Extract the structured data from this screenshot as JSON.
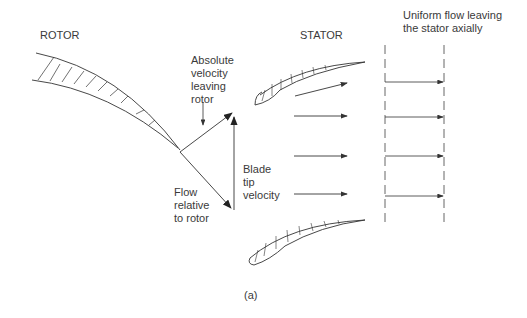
{
  "labels": {
    "rotor": "ROTOR",
    "stator": "STATOR",
    "uniform_flow": "Uniform flow leaving\nthe stator axially",
    "absolute_velocity": "Absolute\nvelocity\nleaving\nrotor",
    "blade_tip_velocity": "Blade\ntip\nvelocity",
    "flow_relative": "Flow\nrelative\nto rotor",
    "caption": "(a)"
  },
  "colors": {
    "line": "#333333",
    "background": "#ffffff"
  }
}
